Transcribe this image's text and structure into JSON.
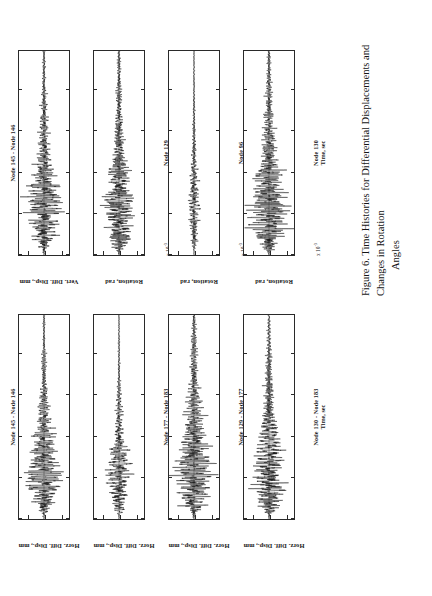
{
  "figure": {
    "caption_line1": "Figure 6.  Time Histories for Differential Displacements and Changes in Rotation",
    "caption_line2": "Angles",
    "rotation_note": "figure printed rotated 90 degrees counter-clockwise on the page"
  },
  "axes_common": {
    "xlabel": "Time, sec",
    "xticks": [
      "0",
      "10",
      "20",
      "30",
      "40",
      "50"
    ],
    "xlim": [
      0,
      50
    ],
    "exp_prefix": "x 10",
    "exp_power": "-3"
  },
  "chart_data": [
    {
      "id": "panel-L1",
      "type": "line",
      "title": "Node 145 - Node 146",
      "title_position": "above",
      "ylabel": "Horz. Diff. Disp., mm",
      "xlabel": "",
      "yticks": [
        "10",
        "0",
        "-10"
      ],
      "ylim": [
        -15,
        15
      ],
      "xlim": [
        0,
        50
      ],
      "xticks": [
        "0",
        "10",
        "20",
        "30",
        "40",
        "50"
      ],
      "grid": false,
      "legend": "none",
      "seed": 11,
      "envelope": {
        "peak_time": 14,
        "rise": 5.5,
        "decay": 11,
        "amplitude": 8.5,
        "tail": 0.1
      },
      "exponent_label": ""
    },
    {
      "id": "panel-L2",
      "type": "line",
      "title": "Node 177 - Node 183",
      "title_position": "below",
      "ylabel": "Horz. Diff. Disp., mm",
      "xlabel": "",
      "yticks": [
        "10",
        "0",
        "-10"
      ],
      "ylim": [
        -15,
        15
      ],
      "xlim": [
        0,
        50
      ],
      "xticks": [
        "0",
        "10",
        "20",
        "30",
        "40",
        "50"
      ],
      "grid": false,
      "legend": "none",
      "seed": 23,
      "envelope": {
        "peak_time": 13,
        "rise": 5.0,
        "decay": 10,
        "amplitude": 6.0,
        "tail": 0.09
      },
      "exponent_label": ""
    },
    {
      "id": "panel-L3",
      "type": "line",
      "title": "Node 129 - Node 177",
      "title_position": "below",
      "ylabel": "Horz. Diff. Disp., mm",
      "xlabel": "",
      "yticks": [
        "10",
        "0",
        "-10"
      ],
      "ylim": [
        -15,
        15
      ],
      "xlim": [
        0,
        50
      ],
      "xticks": [
        "0",
        "10",
        "20",
        "30",
        "40",
        "50"
      ],
      "grid": false,
      "legend": "none",
      "seed": 37,
      "envelope": {
        "peak_time": 15,
        "rise": 5.5,
        "decay": 13,
        "amplitude": 9.5,
        "tail": 0.16
      },
      "exponent_label": ""
    },
    {
      "id": "panel-L4",
      "type": "line",
      "title": "Node 130 - Node 183",
      "title_position": "below",
      "ylabel": "Horz. Diff. Disp., mm",
      "xlabel": "Time, sec",
      "yticks": [
        "10",
        "0",
        "-10"
      ],
      "ylim": [
        -15,
        15
      ],
      "xlim": [
        0,
        50
      ],
      "xticks": [
        "0",
        "10",
        "20",
        "30",
        "40",
        "50"
      ],
      "grid": false,
      "legend": "none",
      "seed": 53,
      "envelope": {
        "peak_time": 14,
        "rise": 5.5,
        "decay": 12,
        "amplitude": 9.0,
        "tail": 0.13
      },
      "exponent_label": ""
    },
    {
      "id": "panel-R1",
      "type": "line",
      "title": "Node 145 - Node 146",
      "title_position": "above",
      "ylabel": "Vert. Diff. Disp., mm",
      "xlabel": "",
      "yticks": [
        "10",
        "0",
        "-10"
      ],
      "ylim": [
        -15,
        15
      ],
      "xlim": [
        0,
        50
      ],
      "xticks": [
        "0",
        "10",
        "20",
        "30",
        "40",
        "50"
      ],
      "grid": false,
      "legend": "none",
      "seed": 71,
      "envelope": {
        "peak_time": 14,
        "rise": 5.5,
        "decay": 12,
        "amplitude": 9.0,
        "tail": 0.14
      },
      "exponent_label": ""
    },
    {
      "id": "panel-R2",
      "type": "line",
      "title": "Node 129",
      "title_position": "below",
      "ylabel": "Rotation, rad",
      "xlabel": "",
      "yticks": [
        "1",
        "0",
        "-1"
      ],
      "ylim": [
        -1.5,
        1.5
      ],
      "xlim": [
        0,
        50
      ],
      "xticks": [
        "0",
        "10",
        "20",
        "30",
        "40",
        "50"
      ],
      "grid": false,
      "legend": "none",
      "seed": 89,
      "envelope": {
        "peak_time": 14,
        "rise": 5.5,
        "decay": 12,
        "amplitude": 0.85,
        "tail": 0.18
      },
      "exponent_label": "x 10-3"
    },
    {
      "id": "panel-R3",
      "type": "line",
      "title": "Node 96",
      "title_position": "below",
      "ylabel": "Rotation, rad",
      "xlabel": "",
      "yticks": [
        "1",
        "0",
        "-1"
      ],
      "ylim": [
        -1.5,
        1.5
      ],
      "xlim": [
        0,
        50
      ],
      "xticks": [
        "0",
        "10",
        "20",
        "30",
        "40",
        "50"
      ],
      "grid": false,
      "legend": "none",
      "seed": 101,
      "envelope": {
        "peak_time": 15,
        "rise": 6.0,
        "decay": 13,
        "amplitude": 0.3,
        "tail": 0.1
      },
      "exponent_label": "x 10-3"
    },
    {
      "id": "panel-R4",
      "type": "line",
      "title": "Node 130",
      "title_position": "below",
      "ylabel": "Rotation, rad",
      "xlabel": "Time, sec",
      "yticks": [
        "1",
        "0",
        "-1"
      ],
      "ylim": [
        -1.5,
        1.5
      ],
      "xlim": [
        0,
        50
      ],
      "xticks": [
        "0",
        "10",
        "20",
        "30",
        "40",
        "50"
      ],
      "grid": false,
      "legend": "none",
      "seed": 127,
      "envelope": {
        "peak_time": 14,
        "rise": 5.0,
        "decay": 12,
        "amplitude": 1.0,
        "tail": 0.17
      },
      "exponent_label": "x 10-3"
    }
  ]
}
